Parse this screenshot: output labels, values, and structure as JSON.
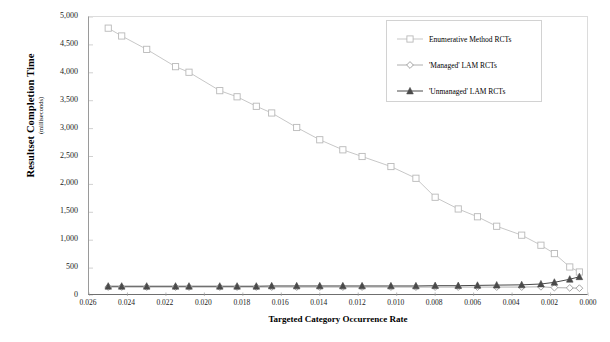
{
  "chart_data": {
    "type": "line",
    "title": "",
    "subtitle": "",
    "xlabel": "Targeted Category Occurrence Rate",
    "ylabel": "Resultset Completion Time",
    "ylabel_units": "(milliseconds)",
    "xlim": [
      0.026,
      0.0
    ],
    "ylim": [
      0,
      5000
    ],
    "x_reversed": true,
    "grid": false,
    "legend_position": "top-right-inside",
    "xticks": [
      "0.026",
      "0.024",
      "0.022",
      "0.020",
      "0.018",
      "0.016",
      "0.014",
      "0.012",
      "0.010",
      "0.008",
      "0.006",
      "0.004",
      "0.002",
      "0.000"
    ],
    "xtick_values": [
      0.026,
      0.024,
      0.022,
      0.02,
      0.018,
      0.016,
      0.014,
      0.012,
      0.01,
      0.008,
      0.006,
      0.004,
      0.002,
      0.0
    ],
    "yticks": [
      "0",
      "500",
      "1,000",
      "1,500",
      "2,000",
      "2,500",
      "3,000",
      "3,500",
      "4,000",
      "4,500",
      "5,000"
    ],
    "ytick_values": [
      0,
      500,
      1000,
      1500,
      2000,
      2500,
      3000,
      3500,
      4000,
      4500,
      5000
    ],
    "x": [
      0.025,
      0.0243,
      0.023,
      0.0215,
      0.0208,
      0.0192,
      0.0183,
      0.0173,
      0.0165,
      0.0152,
      0.014,
      0.0128,
      0.0118,
      0.0103,
      0.009,
      0.008,
      0.0068,
      0.0058,
      0.0048,
      0.0035,
      0.0025,
      0.0018,
      0.001,
      0.0005
    ],
    "series": [
      {
        "name": "Enumerative Method RCTs",
        "marker": "open-square",
        "color": "#b9b9b9",
        "values": [
          4800,
          4660,
          4420,
          4110,
          4010,
          3680,
          3570,
          3400,
          3280,
          3020,
          2800,
          2620,
          2500,
          2320,
          2110,
          1770,
          1560,
          1420,
          1250,
          1090,
          910,
          760,
          520,
          430
        ]
      },
      {
        "name": "'Managed' LAM RCTs",
        "marker": "open-diamond",
        "color": "#9a9a9a",
        "values": [
          160,
          160,
          160,
          160,
          160,
          160,
          160,
          160,
          160,
          160,
          160,
          160,
          160,
          160,
          160,
          160,
          160,
          160,
          160,
          160,
          165,
          150,
          145,
          140
        ]
      },
      {
        "name": "'Unmanaged' LAM RCTs",
        "marker": "filled-triangle",
        "color": "#4a4a4a",
        "values": [
          175,
          175,
          175,
          175,
          175,
          175,
          175,
          175,
          180,
          180,
          180,
          180,
          180,
          180,
          180,
          185,
          185,
          190,
          195,
          200,
          215,
          245,
          300,
          345
        ]
      }
    ]
  },
  "legend": {
    "items": [
      {
        "label": "Enumerative Method RCTs",
        "marker": "open-square"
      },
      {
        "label": "'Managed' LAM RCTs",
        "marker": "open-diamond"
      },
      {
        "label": "'Unmanaged' LAM RCTs",
        "marker": "filled-triangle"
      }
    ]
  }
}
